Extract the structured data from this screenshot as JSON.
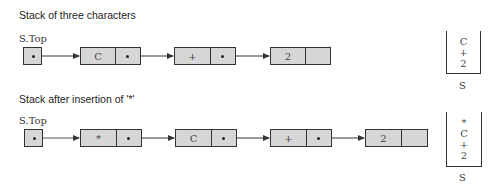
{
  "diagrams": [
    {
      "title": "Stack of three characters",
      "top_label": "S.Top",
      "nodes": [
        "C",
        "+",
        "2"
      ],
      "stack_items": [
        "C",
        "+",
        "2"
      ],
      "stack_label": "S"
    },
    {
      "title": "Stack after insertion of '*'",
      "top_label": "S.Top",
      "nodes": [
        "*",
        "C",
        "+",
        "2"
      ],
      "stack_items": [
        "*",
        "C",
        "+",
        "2"
      ],
      "stack_label": "S"
    }
  ]
}
